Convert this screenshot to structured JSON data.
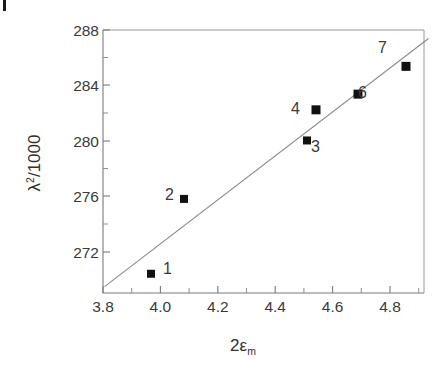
{
  "figure": {
    "crop_mark_name": "crop-registration-mark"
  },
  "chart_data": {
    "type": "scatter",
    "title": "",
    "subtitle": "",
    "xlabel": "2εm",
    "xlabel_parts": {
      "lead": "2ε",
      "sub": "m"
    },
    "ylabel": "λ²/1000",
    "ylabel_parts": {
      "lead": "λ",
      "sup": "2",
      "tail": "/1000"
    },
    "xlim": [
      3.8,
      4.87
    ],
    "ylim": [
      270.15,
      288.6
    ],
    "grid": false,
    "legend": null,
    "x_ticks": [
      3.8,
      4.0,
      4.2,
      4.4,
      4.6,
      4.8
    ],
    "x_tick_labels": [
      "3.8",
      "4.0",
      "4.2",
      "4.4",
      "4.6",
      "4.8"
    ],
    "x_minor_ticks": [
      3.9,
      4.1,
      4.3,
      4.5,
      4.7
    ],
    "y_ticks": [
      272,
      276,
      280,
      284,
      288
    ],
    "y_tick_labels": [
      "272",
      "276",
      "280",
      "284",
      "288"
    ],
    "y_minor_ticks": [
      274,
      278,
      282,
      286
    ],
    "points": [
      {
        "label": "1",
        "x": 3.96,
        "y": 271.5,
        "label_side": "right"
      },
      {
        "label": "2",
        "x": 4.07,
        "y": 276.75,
        "label_side": "left"
      },
      {
        "label": "3",
        "x": 4.48,
        "y": 280.85,
        "label_side": "right-below"
      },
      {
        "label": "4",
        "x": 4.51,
        "y": 283.0,
        "label_side": "left"
      },
      {
        "label": "6",
        "x": 4.65,
        "y": 284.1,
        "label_side": "right"
      },
      {
        "label": "7",
        "x": 4.81,
        "y": 286.05,
        "label_side": "left-above"
      }
    ],
    "fit_line": {
      "name": "linear-regression-line",
      "x_start": 3.805,
      "y_start": 270.6,
      "x_end": 4.885,
      "y_end": 288.0
    },
    "colors": {
      "marker": "#111111",
      "fit_line": "#8a8a8a",
      "axis": "#7a7a7a",
      "text": "#3a3a3a",
      "background": "#ffffff"
    }
  }
}
